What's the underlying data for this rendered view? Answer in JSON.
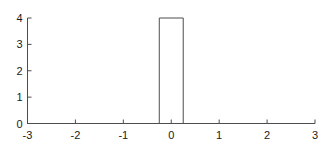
{
  "chart_data": {
    "type": "line",
    "title": "",
    "subtitle": "",
    "xlabel": "",
    "ylabel": "",
    "xlim": [
      -3,
      3
    ],
    "ylim": [
      0,
      4
    ],
    "xticks": [
      -3,
      -2,
      -1,
      0,
      1,
      2,
      3
    ],
    "xtick_labels": [
      "-3",
      "-2",
      "-1",
      "0",
      "1",
      "2",
      "3"
    ],
    "yticks": [
      0,
      1,
      2,
      3,
      4
    ],
    "ytick_labels": [
      "0",
      "1",
      "2",
      "3",
      "4"
    ],
    "grid": false,
    "legend": false,
    "legend_position": "none",
    "line_color": "#4d4d4d",
    "line_width": 1,
    "axis_color": "#4d4d4d",
    "background_color": "#ffffff",
    "series": [
      {
        "name": "rectangular-pulse",
        "x": [
          -3,
          -0.25,
          -0.25,
          0.25,
          0.25,
          3
        ],
        "values": [
          0,
          0,
          4,
          4,
          0,
          0
        ]
      }
    ],
    "pulse": {
      "amplitude": 4,
      "center": 0,
      "width": 0.5,
      "left_edge": -0.25,
      "right_edge": 0.25,
      "baseline": 0
    }
  }
}
